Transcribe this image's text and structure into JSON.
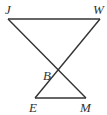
{
  "diagram": {
    "type": "geometry",
    "points": {
      "J": {
        "label": "J",
        "x": 8,
        "y": 19,
        "lx": 5,
        "ly": 14
      },
      "W": {
        "label": "W",
        "x": 100,
        "y": 19,
        "lx": 93,
        "ly": 14
      },
      "B": {
        "label": "B",
        "x": 59,
        "y": 69,
        "lx": 43,
        "ly": 80
      },
      "E": {
        "label": "E",
        "x": 35,
        "y": 98,
        "lx": 29,
        "ly": 112
      },
      "M": {
        "label": "M",
        "x": 86,
        "y": 98,
        "lx": 80,
        "ly": 112
      }
    },
    "segments": [
      [
        "J",
        "W"
      ],
      [
        "J",
        "M"
      ],
      [
        "W",
        "E"
      ],
      [
        "E",
        "M"
      ]
    ],
    "line_color": "#333333"
  }
}
